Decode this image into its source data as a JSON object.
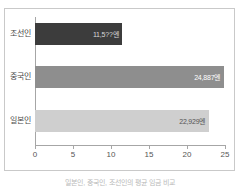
{
  "chart_data": {
    "type": "bar",
    "orientation": "horizontal",
    "title": "",
    "xlabel": "",
    "ylabel": "",
    "categories": [
      "조선인",
      "중국인",
      "일본인"
    ],
    "values": [
      11.5,
      24.887,
      22.929
    ],
    "value_labels": [
      "11,5??엔",
      "24,887엔",
      "22,929엔"
    ],
    "bar_colors": [
      "#3c3c3c",
      "#8e8e8e",
      "#cfcfcf"
    ],
    "value_label_colors": [
      "#d8d8d8",
      "#ffffff",
      "#555555"
    ],
    "xlim": [
      0,
      25
    ],
    "xticks": [
      0,
      5,
      10,
      15,
      20,
      25
    ],
    "xtick_labels": [
      "0",
      "5",
      "10",
      "15",
      "20",
      "25"
    ],
    "grid": false,
    "legend": false,
    "series": [
      {
        "name": "평균 임금(엔)",
        "values": [
          11.5,
          24.887,
          22.929
        ]
      }
    ]
  },
  "caption": {
    "text": "일본인, 중국인, 조선인의 평균 임금 비교"
  },
  "axis": {
    "spine_color": "#a6a6a6",
    "frame_color": "#c9c9c9"
  }
}
